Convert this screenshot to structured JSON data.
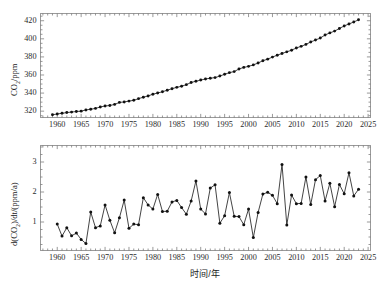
{
  "figure": {
    "background": "#ffffff",
    "line_color": "#222222",
    "marker_color": "#111111",
    "frame_color": "#9a9a9a",
    "xlabel": "时间/年"
  },
  "chart_data": [
    {
      "type": "line",
      "id": "co2-concentration",
      "title": "",
      "xlabel": "时间/年",
      "ylabel": "CO2/ppm",
      "ylabel_parts": {
        "pre": "CO",
        "sub": "2",
        "post": "/ppm"
      },
      "xlim": [
        1956.5,
        2025.5
      ],
      "ylim": [
        313,
        428
      ],
      "xticks": [
        1960,
        1965,
        1970,
        1975,
        1980,
        1985,
        1990,
        1995,
        2000,
        2005,
        2010,
        2015,
        2020,
        2025
      ],
      "yticks": [
        320,
        340,
        360,
        380,
        400,
        420
      ],
      "xtick_minor_step": 1,
      "grid": false,
      "legend": null,
      "markers": "filled-circle",
      "x": [
        1959,
        1960,
        1961,
        1962,
        1963,
        1964,
        1965,
        1966,
        1967,
        1968,
        1969,
        1970,
        1971,
        1972,
        1973,
        1974,
        1975,
        1976,
        1977,
        1978,
        1979,
        1980,
        1981,
        1982,
        1983,
        1984,
        1985,
        1986,
        1987,
        1988,
        1989,
        1990,
        1991,
        1992,
        1993,
        1994,
        1995,
        1996,
        1997,
        1998,
        1999,
        2000,
        2001,
        2002,
        2003,
        2004,
        2005,
        2006,
        2007,
        2008,
        2009,
        2010,
        2011,
        2012,
        2013,
        2014,
        2015,
        2016,
        2017,
        2018,
        2019,
        2020,
        2021,
        2022,
        2023
      ],
      "values": [
        315.98,
        316.91,
        317.64,
        318.45,
        318.99,
        319.62,
        320.04,
        321.37,
        322.18,
        323.05,
        324.62,
        325.68,
        326.32,
        327.46,
        329.68,
        330.19,
        331.12,
        332.03,
        333.84,
        335.41,
        336.84,
        338.76,
        340.12,
        341.48,
        343.15,
        344.87,
        346.35,
        347.61,
        349.31,
        351.69,
        353.12,
        354.39,
        355.61,
        356.45,
        357.1,
        358.83,
        360.82,
        362.61,
        363.73,
        366.7,
        368.38,
        369.55,
        371.14,
        373.28,
        375.8,
        377.52,
        379.8,
        381.9,
        383.79,
        385.6,
        387.43,
        389.9,
        391.65,
        393.85,
        396.52,
        398.65,
        400.83,
        404.24,
        406.55,
        408.52,
        411.44,
        414.24,
        416.45,
        418.56,
        421.08
      ]
    },
    {
      "type": "line",
      "id": "co2-growth-rate",
      "title": "",
      "xlabel": "时间/年",
      "ylabel": "d(CO2)/dt/(ppm/a)",
      "ylabel_parts": {
        "pre": "d(CO",
        "sub": "2",
        "post": ")/dt/(ppm/a)"
      },
      "xlim": [
        1956.5,
        2025.5
      ],
      "ylim": [
        0.05,
        3.55
      ],
      "xticks": [
        1960,
        1965,
        1970,
        1975,
        1980,
        1985,
        1990,
        1995,
        2000,
        2005,
        2010,
        2015,
        2020,
        2025
      ],
      "yticks": [
        1,
        2,
        3
      ],
      "xtick_minor_step": 1,
      "grid": false,
      "legend": null,
      "markers": "filled-circle",
      "x": [
        1960,
        1961,
        1962,
        1963,
        1964,
        1965,
        1966,
        1967,
        1968,
        1969,
        1970,
        1971,
        1972,
        1973,
        1974,
        1975,
        1976,
        1977,
        1978,
        1979,
        1980,
        1981,
        1982,
        1983,
        1984,
        1985,
        1986,
        1987,
        1988,
        1989,
        1990,
        1991,
        1992,
        1993,
        1994,
        1995,
        1996,
        1997,
        1998,
        1999,
        2000,
        2001,
        2002,
        2003,
        2004,
        2005,
        2006,
        2007,
        2008,
        2009,
        2010,
        2011,
        2012,
        2013,
        2014,
        2015,
        2016,
        2017,
        2018,
        2019,
        2020,
        2021,
        2022,
        2023
      ],
      "values": [
        0.93,
        0.53,
        0.81,
        0.54,
        0.63,
        0.42,
        0.28,
        1.33,
        0.81,
        0.87,
        1.57,
        1.06,
        0.64,
        1.14,
        1.73,
        0.79,
        0.93,
        0.91,
        1.81,
        1.57,
        1.43,
        1.92,
        1.35,
        1.36,
        1.67,
        1.72,
        1.48,
        1.26,
        1.7,
        2.37,
        1.43,
        1.27,
        2.13,
        2.24,
        0.96,
        1.21,
        1.98,
        1.19,
        1.18,
        0.91,
        1.43,
        0.48,
        1.32,
        1.93,
        1.99,
        1.89,
        1.61,
        2.92,
        0.9,
        1.9,
        1.61,
        1.62,
        2.5,
        1.58,
        2.41,
        2.55,
        1.7,
        2.29,
        1.51,
        2.25,
        1.94,
        2.64,
        1.87,
        2.09,
        2.99,
        2.96,
        1.88,
        2.84,
        2.45,
        2.37,
        2.35,
        2.32,
        1.79,
        3.36
      ]
    }
  ]
}
